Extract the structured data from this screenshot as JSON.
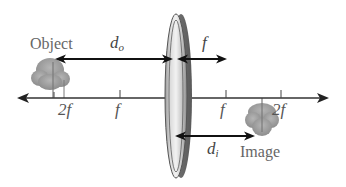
{
  "diagram": {
    "type": "thin-lens-ray-setup",
    "labels": {
      "object": "Object",
      "image": "Image",
      "d_o_main": "d",
      "d_o_sub": "o",
      "d_i_main": "d",
      "d_i_sub": "i",
      "f_top": "f"
    },
    "axis_ticks": [
      {
        "label": "2f",
        "x": 54
      },
      {
        "label": "f",
        "x": 120
      },
      {
        "label": "f",
        "x": 226
      },
      {
        "label": "2f",
        "x": 281
      }
    ],
    "lens": {
      "x": 177,
      "type": "converging"
    },
    "colors": {
      "axis": "#333333",
      "arrow": "#111111",
      "lens_dark": "#8a8a8a",
      "lens_light": "#e6e6e6",
      "tree": "#9a9a9a",
      "text": "#555555"
    }
  }
}
